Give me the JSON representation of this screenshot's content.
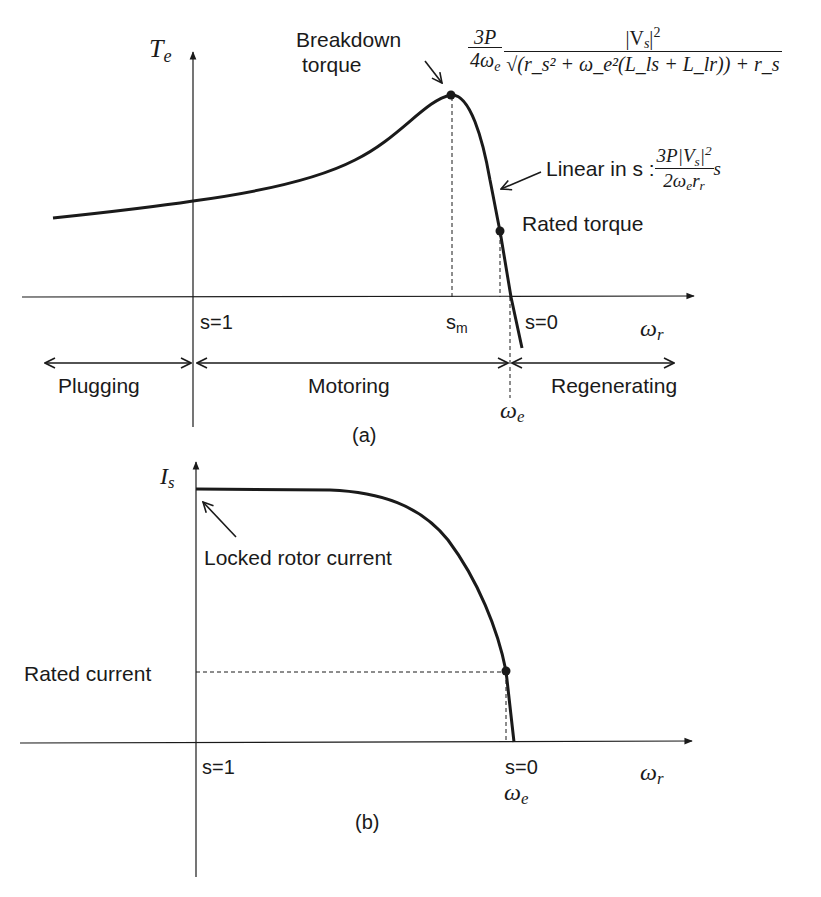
{
  "figure_a": {
    "y_axis_label": "T",
    "y_axis_sub": "e",
    "x_axis_label": "ω",
    "x_axis_sub": "r",
    "tick_s1": "s=1",
    "tick_sm": "s",
    "tick_sm_sub": "m",
    "tick_s0": "s=0",
    "omega_e": "ω",
    "omega_e_sub": "e",
    "breakdown_label_line1": "Breakdown",
    "breakdown_label_line2": "torque",
    "breakdown_formula": {
      "coef_num": "3P",
      "coef_den": "4ω",
      "coef_den_sub": "e",
      "num": "|V",
      "num_sub": "s",
      "num_tail": "|",
      "num_sup": "2",
      "den": "√(r_s² + ω_e²(L_ls + L_lr)) + r_s"
    },
    "linear_label": "Linear in s :",
    "linear_formula": {
      "num": "3P|V",
      "num_sub": "s",
      "num_tail": "|",
      "num_sup": "2",
      "den": "2ω",
      "den_sub": "e",
      "den_tail": "r",
      "den_tail_sub": "r",
      "factor": "s"
    },
    "rated_torque_label": "Rated torque",
    "regions": [
      {
        "label": "Plugging"
      },
      {
        "label": "Motoring"
      },
      {
        "label": "Regenerating"
      }
    ],
    "caption": "(a)"
  },
  "figure_b": {
    "y_axis_label": "I",
    "y_axis_sub": "s",
    "x_axis_label": "ω",
    "x_axis_sub": "r",
    "tick_s1": "s=1",
    "tick_s0": "s=0",
    "omega_e": "ω",
    "omega_e_sub": "e",
    "locked_rotor_label": "Locked rotor current",
    "rated_current_label": "Rated current",
    "caption": "(b)"
  },
  "colors": {
    "ink": "#1a1a1a",
    "background": "#ffffff"
  }
}
